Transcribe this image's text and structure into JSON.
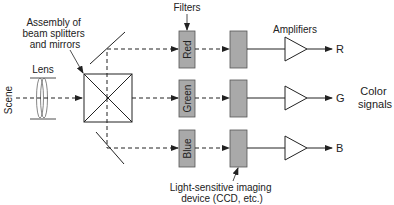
{
  "diagram": {
    "labels": {
      "scene": "Scene",
      "lens": "Lens",
      "assembly_line1": "Assembly of",
      "assembly_line2": "beam splitters",
      "assembly_line3": "and mirrors",
      "filters": "Filters",
      "amplifiers": "Amplifiers",
      "ccd_line1": "Light-sensitive imaging",
      "ccd_line2": "device (CCD, etc.)",
      "color_signals_line1": "Color",
      "color_signals_line2": "signals"
    },
    "channels": [
      {
        "filter": "Red",
        "output": "R"
      },
      {
        "filter": "Green",
        "output": "G"
      },
      {
        "filter": "Blue",
        "output": "B"
      }
    ],
    "colors": {
      "line": "#222222",
      "box_fill": "#a9a9a9",
      "box_stroke": "#555555"
    }
  }
}
